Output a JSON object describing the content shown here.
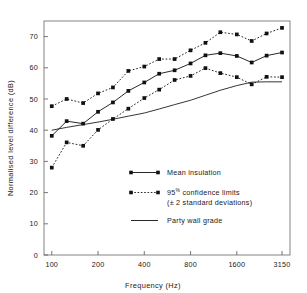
{
  "chart_data": {
    "type": "line",
    "title": "",
    "xlabel": "Frequency  (Hz)",
    "ylabel": "Normalised level difference  (dB)",
    "xscale": "log",
    "xlim": [
      89,
      3550
    ],
    "ylim": [
      0,
      75
    ],
    "grid": false,
    "legend_position": "inside-lower-right",
    "x": [
      100,
      125,
      160,
      200,
      250,
      315,
      400,
      500,
      630,
      800,
      1000,
      1250,
      1600,
      2000,
      2500,
      3150
    ],
    "xticks": [
      "100",
      "200",
      "400",
      "800",
      "1600",
      "3150"
    ],
    "xtick_values": [
      100,
      200,
      400,
      800,
      1600,
      3150
    ],
    "yticks": [
      "0",
      "10",
      "20",
      "30",
      "40",
      "50",
      "60",
      "70"
    ],
    "ytick_values": [
      0,
      10,
      20,
      30,
      40,
      50,
      60,
      70
    ],
    "series": [
      {
        "name": "95% confidence limits (upper)",
        "style": "dashed-marker",
        "values": [
          47.7,
          50.0,
          48.7,
          51.8,
          53.7,
          59.0,
          60.4,
          62.8,
          62.8,
          65.6,
          68.0,
          71.4,
          70.7,
          68.6,
          71.0,
          72.8
        ]
      },
      {
        "name": "Mean insulation",
        "style": "solid-marker",
        "values": [
          38.2,
          42.9,
          42.1,
          45.9,
          48.9,
          52.6,
          55.3,
          58.1,
          59.2,
          61.4,
          64.0,
          64.7,
          63.8,
          61.7,
          63.9,
          64.9
        ]
      },
      {
        "name": "95% confidence limits (lower)",
        "style": "dashed-marker",
        "values": [
          28.0,
          36.1,
          35.0,
          40.1,
          43.6,
          46.9,
          50.3,
          53.0,
          56.1,
          57.4,
          59.9,
          58.3,
          57.0,
          54.7,
          57.1,
          57.0
        ]
      },
      {
        "name": "Party wall grade",
        "style": "plain-line",
        "values": [
          40.0,
          40.9,
          41.8,
          42.6,
          43.5,
          44.5,
          45.5,
          46.8,
          48.2,
          49.6,
          51.2,
          52.8,
          54.3,
          55.4,
          55.5,
          55.5
        ]
      }
    ],
    "legend": [
      {
        "id": "mean",
        "label": "Mean insulation",
        "style": "solid-marker"
      },
      {
        "id": "ci",
        "label_pre": "95",
        "label_pct": "%",
        "label_post": "confidence limits",
        "label_line2": "(± 2 standard deviations)",
        "style": "dashed-marker"
      },
      {
        "id": "grade",
        "label": "Party wall grade",
        "style": "plain-line"
      }
    ]
  },
  "colors": {
    "ink": "#111111",
    "axis": "#555555",
    "background": "#ffffff"
  }
}
